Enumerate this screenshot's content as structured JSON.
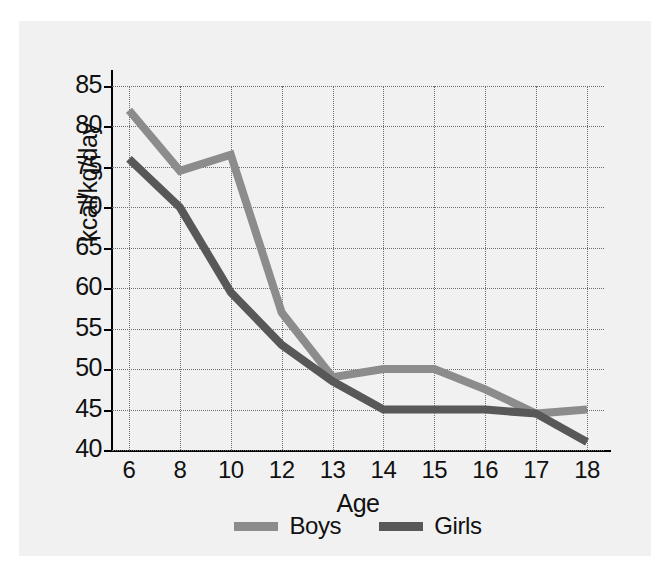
{
  "chart_data": {
    "type": "line",
    "title": "",
    "subtitle": "",
    "xlabel": "Age",
    "ylabel": "kcal/kg/day",
    "categories": [
      "6",
      "8",
      "10",
      "12",
      "13",
      "14",
      "15",
      "16",
      "17",
      "18"
    ],
    "x_tick_labels": [
      "6",
      "8",
      "10",
      "12",
      "13",
      "14",
      "15",
      "16",
      "17",
      "18"
    ],
    "y_tick_labels": [
      "85",
      "80",
      "75",
      "70",
      "65",
      "60",
      "55",
      "50",
      "45",
      "40"
    ],
    "y_ticks": [
      85,
      80,
      75,
      70,
      65,
      60,
      55,
      50,
      45,
      40
    ],
    "ylim": [
      40,
      85
    ],
    "grid": "dotted both axes",
    "legend_position": "bottom-center",
    "series": [
      {
        "name": "Boys",
        "color": "#8c8c8c",
        "values": [
          82,
          74.5,
          76.5,
          57,
          49,
          50,
          50,
          47.5,
          44.5,
          45
        ]
      },
      {
        "name": "Girls",
        "color": "#585858",
        "values": [
          76,
          70,
          59.5,
          53,
          48.5,
          45,
          45,
          45,
          44.5,
          41
        ]
      }
    ]
  },
  "legend": {
    "entries": [
      {
        "label": "Boys"
      },
      {
        "label": "Girls"
      }
    ]
  },
  "colors": {
    "boys": "#8c8c8c",
    "girls": "#585858",
    "panel_background": "#f1f1f1",
    "figure_background": "#ffffff",
    "axis": "#000000",
    "grid": "#6d6d6d",
    "text": "#111111"
  }
}
